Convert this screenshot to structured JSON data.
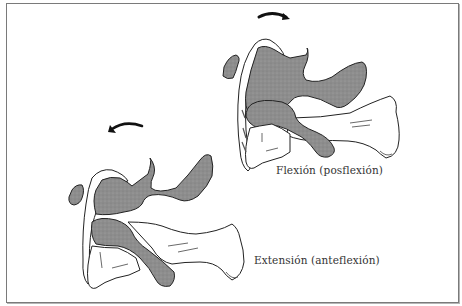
{
  "figure": {
    "panels": [
      {
        "id": "flexion",
        "label": "Flexión (posflexión)",
        "arrow_direction": "clockwise"
      },
      {
        "id": "extension",
        "label": "Extensión (anteflexión)",
        "arrow_direction": "counterclockwise"
      }
    ],
    "colors": {
      "outline": "#222222",
      "shaded_bone": "#8a8a8a",
      "background": "#ffffff",
      "frame": "#7a7a7a"
    }
  }
}
